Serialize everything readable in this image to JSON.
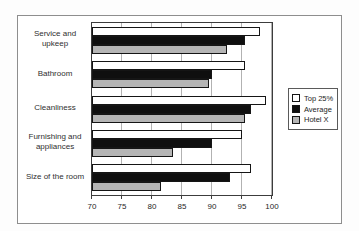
{
  "figure": {
    "background": "#ffffff",
    "border_color": "#8e8e8e"
  },
  "chart_data": {
    "type": "bar",
    "orientation": "horizontal",
    "title": "",
    "xlabel": "",
    "ylabel": "",
    "categories": [
      "Service and upkeep",
      "Bathroom",
      "Cleanliness",
      "Furnishing and appliances",
      "Size of the room"
    ],
    "series": [
      {
        "name": "Top 25%",
        "color": "#ffffff",
        "values": [
          98,
          95.5,
          99,
          95,
          96.5
        ]
      },
      {
        "name": "Average",
        "color": "#0f0f0f",
        "values": [
          95.5,
          90,
          96.5,
          90,
          93
        ]
      },
      {
        "name": "Hotel X",
        "color": "#b5b5b5",
        "values": [
          92.5,
          89.5,
          95.5,
          83.5,
          81.5
        ]
      }
    ],
    "xlim": [
      70,
      100
    ],
    "xticks": [
      70,
      75,
      80,
      85,
      90,
      95,
      100
    ],
    "grid": true,
    "legend_position": "right",
    "bar_border_color": "#151515",
    "gridline_color": "#b2b2b2"
  }
}
